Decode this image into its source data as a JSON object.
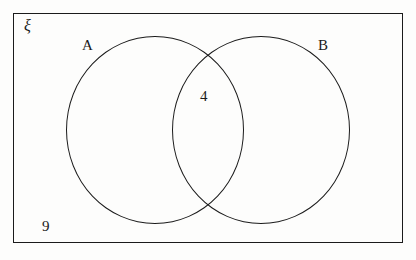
{
  "diagram": {
    "type": "venn-diagram",
    "universal_set": {
      "symbol": "ξ",
      "name": "universal-set"
    },
    "sets": [
      {
        "label": "A",
        "name": "set-a"
      },
      {
        "label": "B",
        "name": "set-b"
      }
    ],
    "regions": [
      {
        "name": "intersection",
        "label": "4",
        "value": 4
      },
      {
        "name": "outside-both",
        "label": "9",
        "value": 9
      },
      {
        "name": "a-only",
        "label": "",
        "value": null
      },
      {
        "name": "b-only",
        "label": "",
        "value": null
      }
    ],
    "colors": {
      "stroke": "#1b1b1b",
      "background": "#fdfdfc",
      "text": "#1a1a1a"
    }
  },
  "chart_data": {
    "type": "diagram",
    "subtype": "venn",
    "universal_set_symbol": "ξ",
    "set_labels": [
      "A",
      "B"
    ],
    "region_values": {
      "A_only": null,
      "B_only": null,
      "A_and_B": 4,
      "neither": 9
    },
    "annotations": [
      "ξ",
      "A",
      "B",
      "4",
      "9"
    ]
  }
}
